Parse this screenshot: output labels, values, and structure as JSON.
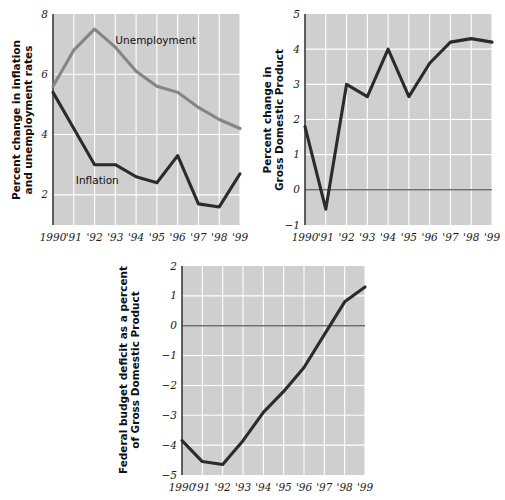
{
  "chart_data": [
    {
      "id": "inflation-unemployment",
      "type": "line",
      "title": "",
      "xlabel": "",
      "ylabel": "Percent change in inflation and unemployment rates",
      "ylabel_lines": [
        "Percent change in inflation",
        "and unemployment rates"
      ],
      "x": [
        1990,
        1991,
        1992,
        1993,
        1994,
        1995,
        1996,
        1997,
        1998,
        1999
      ],
      "categories": [
        "1990",
        "'91",
        "'92",
        "'93",
        "'94",
        "'95",
        "'96",
        "'97",
        "'98",
        "'99"
      ],
      "ylim": [
        1,
        8
      ],
      "yticks": [
        2,
        4,
        6,
        8
      ],
      "ytick_labels": [
        "2",
        "4",
        "6",
        "8"
      ],
      "grid": true,
      "legend_position": "inline-annotation",
      "series": [
        {
          "name": "Unemployment",
          "color": "#858585",
          "values": [
            5.6,
            6.8,
            7.5,
            6.9,
            6.1,
            5.6,
            5.4,
            4.9,
            4.5,
            4.2
          ],
          "label_x": 1993.0,
          "label_y": 7.0
        },
        {
          "name": "Inflation",
          "color": "#2b2b2b",
          "values": [
            5.4,
            4.2,
            3.0,
            3.0,
            2.6,
            2.4,
            3.3,
            1.7,
            1.6,
            2.7
          ],
          "label_x": 1991.1,
          "label_y": 2.35
        }
      ]
    },
    {
      "id": "gdp-percent-change",
      "type": "line",
      "title": "",
      "xlabel": "",
      "ylabel": "Percent change in Gross Domestic Product",
      "ylabel_lines": [
        "Percent change in",
        "Gross Domestic Product"
      ],
      "x": [
        1990,
        1991,
        1992,
        1993,
        1994,
        1995,
        1996,
        1997,
        1998,
        1999
      ],
      "categories": [
        "1990",
        "'91",
        "'92",
        "'93",
        "'94",
        "'95",
        "'96",
        "'97",
        "'98",
        "'99"
      ],
      "ylim": [
        -1,
        5
      ],
      "yticks": [
        -1,
        0,
        1,
        2,
        3,
        4,
        5
      ],
      "ytick_labels": [
        "−1",
        "0",
        "1",
        "2",
        "3",
        "4",
        "5"
      ],
      "grid": true,
      "zero_line": 0,
      "series": [
        {
          "name": "Percent change in Gross Domestic Product",
          "color": "#2b2b2b",
          "values": [
            1.8,
            -0.55,
            3.0,
            2.65,
            4.0,
            2.65,
            3.6,
            4.2,
            4.3,
            4.2
          ]
        }
      ]
    },
    {
      "id": "federal-budget-deficit",
      "type": "line",
      "title": "",
      "xlabel": "",
      "ylabel": "Federal budget deficit as a percent of Gross Domestic Product",
      "ylabel_lines": [
        "Federal budget deficit as a percent",
        "of Gross Domestic Product"
      ],
      "x": [
        1990,
        1991,
        1992,
        1993,
        1994,
        1995,
        1996,
        1997,
        1998,
        1999
      ],
      "categories": [
        "1990",
        "'91",
        "'92",
        "'93",
        "'94",
        "'95",
        "'96",
        "'97",
        "'98",
        "'99"
      ],
      "ylim": [
        -5,
        2
      ],
      "yticks": [
        -5,
        -4,
        -3,
        -2,
        -1,
        0,
        1,
        2
      ],
      "ytick_labels": [
        "−5",
        "−4",
        "−3",
        "−2",
        "−1",
        "0",
        "1",
        "2"
      ],
      "grid": true,
      "zero_line": 0,
      "series": [
        {
          "name": "Federal budget deficit as a percent of Gross Domestic Product",
          "color": "#2b2b2b",
          "values": [
            -3.85,
            -4.55,
            -4.65,
            -3.85,
            -2.9,
            -2.2,
            -1.4,
            -0.3,
            0.8,
            1.3
          ]
        }
      ]
    }
  ],
  "colors": {
    "plot_background": "#cfcfcf",
    "gridline": "#ffffff",
    "axis": "#3a3a3a",
    "dark_series": "#2b2b2b",
    "gray_series": "#858585",
    "zero_line": "#6e6e6e",
    "text": "#101010"
  }
}
